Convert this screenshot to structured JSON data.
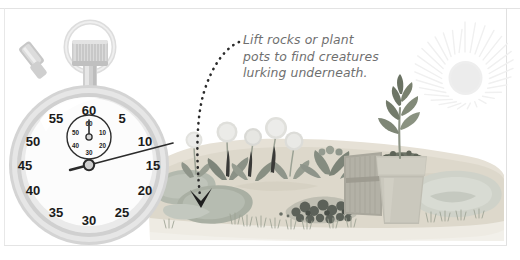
{
  "scene": {
    "title": "Garden minibeast hunt illustration",
    "background_color": "#ffffff",
    "frame_color": "#e4e4e4"
  },
  "annotation": {
    "text": "Lift rocks or plant\npots to find creatures\nlurking underneath.",
    "line1": "Lift rocks or plant",
    "line2": "pots to find creatures",
    "line3": "lurking underneath.",
    "color": "#6f6f6f",
    "pointer": "dotted-curved-arrow"
  },
  "stopwatch": {
    "label": "stopwatch",
    "body_color": "#d8d8d8",
    "face_color": "#fbfbfb",
    "dial_numbers": [
      "5",
      "10",
      "15",
      "20",
      "25",
      "30",
      "35",
      "40",
      "45",
      "50",
      "55",
      "60"
    ],
    "subdial_numbers": [
      "10",
      "20",
      "30",
      "40",
      "50",
      "60"
    ],
    "hand_color": "#2b2b2b",
    "crown": "knurled-crown",
    "ring": "hanging-ring",
    "side_button": "side-plunger"
  },
  "garden": {
    "soil_color": "#d9d4c8",
    "rock_color": "#b9bdb2",
    "plant_color": "#9aa093",
    "items": [
      "rock-left",
      "rock-center",
      "dandelion-cluster",
      "leafy-plant",
      "dark-foliage",
      "wooden-board",
      "plant-pot",
      "seedling",
      "grass-tufts",
      "rock-right"
    ]
  },
  "sun": {
    "label": "sun",
    "color": "#f1f1f1",
    "ray_count": 36
  }
}
